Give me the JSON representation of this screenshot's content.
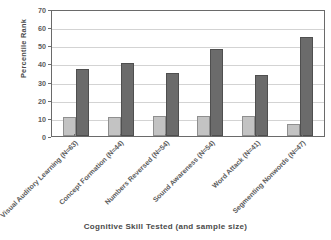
{
  "chart_data": {
    "type": "bar",
    "title": "",
    "subtitle": "",
    "xlabel": "Cognitive Skill Tested (and sample size)",
    "ylabel": "Percentile Rank",
    "ylim": [
      0,
      70
    ],
    "yticks": [
      0,
      10,
      20,
      30,
      40,
      50,
      60,
      70
    ],
    "ytick_labels": [
      "0",
      "10",
      "20",
      "30",
      "40",
      "50",
      "60",
      "70"
    ],
    "grid": "horizontal",
    "legend": "none",
    "categories": [
      "Visual Auditory Learning (N=63)",
      "Concept Formation (N=44)",
      "Numbers Reversed (N=54)",
      "Sound Awareness (N=54)",
      "Word Attack (N=41)",
      "Segmenting Nonwords (N=47)"
    ],
    "series": [
      {
        "name": "pre",
        "color": "#c3c3c3",
        "values": [
          10.5,
          10.5,
          11,
          11,
          11,
          6.5
        ]
      },
      {
        "name": "post",
        "color": "#6b6b6b",
        "values": [
          37,
          40.5,
          35,
          48,
          33.5,
          54.5
        ]
      }
    ],
    "colors": {
      "light_bar": "#c3c3c3",
      "dark_bar": "#6b6b6b",
      "gridline": "#d3d3d3",
      "axis": "#6a6a6a",
      "text": "#5c5c5c",
      "background": "#ffffff"
    }
  }
}
